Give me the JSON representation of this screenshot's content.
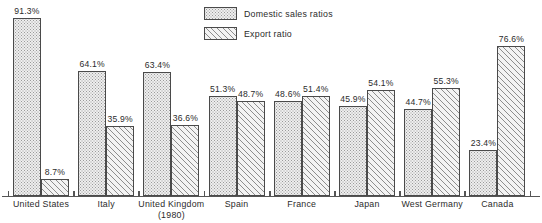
{
  "chart_data": {
    "type": "bar",
    "title": "",
    "subtitle": "",
    "xlabel": "",
    "ylabel": "",
    "ylim": [
      0,
      100
    ],
    "grid": false,
    "legend_position": "top-center",
    "categories": [
      "United States",
      "Italy",
      "United Kingdom",
      "Spain",
      "France",
      "Japan",
      "West Germany",
      "Canada"
    ],
    "category_notes": [
      "",
      "",
      "(1980)",
      "",
      "",
      "",
      "",
      ""
    ],
    "series": [
      {
        "name": "Domestic sales ratios",
        "fill": "dotted",
        "values": [
          91.3,
          64.1,
          63.4,
          51.3,
          48.6,
          45.9,
          44.7,
          23.4
        ],
        "labels": [
          "91.3%",
          "64.1%",
          "63.4%",
          "51.3%",
          "48.6%",
          "45.9%",
          "44.7%",
          "23.4%"
        ]
      },
      {
        "name": "Export ratio",
        "fill": "diagonal-hatch",
        "values": [
          8.7,
          35.9,
          36.6,
          48.7,
          51.4,
          54.1,
          55.3,
          76.6
        ],
        "labels": [
          "8.7%",
          "35.9%",
          "36.6%",
          "48.7%",
          "51.4%",
          "54.1%",
          "55.3%",
          "76.6%"
        ]
      }
    ]
  },
  "legend": {
    "items": [
      {
        "label": "Domestic sales ratios",
        "swatch": "dotted-swatch"
      },
      {
        "label": "Export ratio",
        "swatch": "hatch-swatch"
      }
    ]
  },
  "colors": {
    "domestic_fill": "#eeeeee",
    "export_fill": "#f3f3f3",
    "bar_outline": "#4a4a4a",
    "axis": "#555555",
    "text": "#2b2b2b",
    "background": "#ffffff"
  }
}
